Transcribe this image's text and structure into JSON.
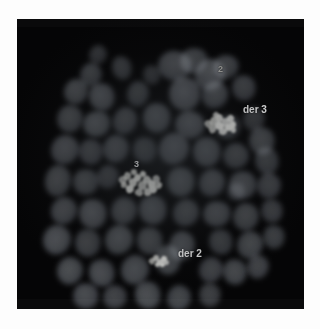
{
  "figure": {
    "kind": "fluorescence-micrograph",
    "modality": "FISH metaphase chromosome spread",
    "frame": {
      "x": 17,
      "y": 19,
      "width": 287,
      "height": 290
    },
    "background_color": "#050506",
    "page_background": "#fdfdfd",
    "chromatin_color": "#5d6166",
    "signal_color": "#f4f4ee",
    "label_color": "#ffffff"
  },
  "labels": [
    {
      "id": "label-2",
      "text": "2",
      "x": 201,
      "y": 46,
      "size": 9,
      "style": "dim"
    },
    {
      "id": "label-der-3",
      "text": "der 3",
      "x": 226,
      "y": 86,
      "size": 10,
      "style": "bright"
    },
    {
      "id": "label-3",
      "text": "3",
      "x": 117,
      "y": 141,
      "size": 9,
      "style": "bright"
    },
    {
      "id": "label-der-2",
      "text": "der 2",
      "x": 161,
      "y": 230,
      "size": 10,
      "style": "bright"
    }
  ],
  "signals": [
    {
      "id": "signal-der-3",
      "label": "der 3",
      "x": 186,
      "y": 92,
      "width": 34,
      "height": 26,
      "speckles": [
        [
          2,
          9,
          7,
          8
        ],
        [
          7,
          6,
          8,
          9
        ],
        [
          13,
          3,
          7,
          8
        ],
        [
          12,
          11,
          9,
          8
        ],
        [
          19,
          7,
          8,
          9
        ],
        [
          24,
          4,
          7,
          7
        ],
        [
          22,
          13,
          8,
          7
        ],
        [
          6,
          15,
          7,
          7
        ],
        [
          16,
          17,
          8,
          7
        ],
        [
          27,
          10,
          6,
          7
        ],
        [
          10,
          1,
          6,
          6
        ],
        [
          28,
          16,
          5,
          6
        ]
      ]
    },
    {
      "id": "signal-3",
      "label": "3",
      "x": 101,
      "y": 150,
      "width": 44,
      "height": 30,
      "speckles": [
        [
          1,
          7,
          8,
          8
        ],
        [
          6,
          3,
          7,
          8
        ],
        [
          11,
          9,
          8,
          9
        ],
        [
          16,
          5,
          7,
          8
        ],
        [
          20,
          12,
          9,
          9
        ],
        [
          25,
          7,
          8,
          8
        ],
        [
          30,
          11,
          8,
          9
        ],
        [
          35,
          6,
          7,
          8
        ],
        [
          38,
          13,
          6,
          7
        ],
        [
          8,
          16,
          8,
          8
        ],
        [
          17,
          20,
          8,
          7
        ],
        [
          26,
          19,
          8,
          8
        ],
        [
          32,
          17,
          7,
          7
        ],
        [
          3,
          13,
          6,
          6
        ],
        [
          13,
          0,
          6,
          6
        ],
        [
          22,
          2,
          6,
          6
        ]
      ]
    },
    {
      "id": "signal-der-2",
      "label": "der 2",
      "x": 132,
      "y": 235,
      "width": 20,
      "height": 13,
      "speckles": [
        [
          0,
          4,
          6,
          6
        ],
        [
          4,
          1,
          6,
          6
        ],
        [
          8,
          5,
          6,
          6
        ],
        [
          12,
          2,
          6,
          6
        ],
        [
          15,
          6,
          5,
          5
        ],
        [
          6,
          8,
          5,
          5
        ],
        [
          11,
          8,
          5,
          5
        ]
      ]
    }
  ],
  "chromosomes": [
    {
      "x": 63,
      "y": 44,
      "w": 22,
      "h": 24,
      "b": 66,
      "r": 12
    },
    {
      "x": 95,
      "y": 37,
      "w": 20,
      "h": 24,
      "b": 60,
      "r": -18
    },
    {
      "x": 141,
      "y": 32,
      "w": 34,
      "h": 30,
      "b": 78,
      "r": 8
    },
    {
      "x": 163,
      "y": 29,
      "w": 28,
      "h": 26,
      "b": 72,
      "r": -14
    },
    {
      "x": 178,
      "y": 40,
      "w": 30,
      "h": 32,
      "b": 84,
      "r": 20
    },
    {
      "x": 196,
      "y": 36,
      "w": 26,
      "h": 24,
      "b": 70,
      "r": -6
    },
    {
      "x": 47,
      "y": 60,
      "w": 24,
      "h": 26,
      "b": 74,
      "r": 16
    },
    {
      "x": 72,
      "y": 64,
      "w": 26,
      "h": 28,
      "b": 80,
      "r": -22
    },
    {
      "x": 110,
      "y": 62,
      "w": 22,
      "h": 26,
      "b": 64,
      "r": 10
    },
    {
      "x": 152,
      "y": 58,
      "w": 32,
      "h": 34,
      "b": 86,
      "r": -10
    },
    {
      "x": 185,
      "y": 62,
      "w": 26,
      "h": 28,
      "b": 76,
      "r": 26
    },
    {
      "x": 215,
      "y": 56,
      "w": 24,
      "h": 26,
      "b": 68,
      "r": -16
    },
    {
      "x": 40,
      "y": 86,
      "w": 26,
      "h": 28,
      "b": 72,
      "r": 6
    },
    {
      "x": 66,
      "y": 92,
      "w": 28,
      "h": 26,
      "b": 82,
      "r": -24
    },
    {
      "x": 96,
      "y": 88,
      "w": 24,
      "h": 28,
      "b": 70,
      "r": 18
    },
    {
      "x": 126,
      "y": 84,
      "w": 28,
      "h": 30,
      "b": 80,
      "r": -8
    },
    {
      "x": 158,
      "y": 92,
      "w": 30,
      "h": 28,
      "b": 84,
      "r": 14
    },
    {
      "x": 198,
      "y": 96,
      "w": 26,
      "h": 24,
      "b": 66,
      "r": -20
    },
    {
      "x": 226,
      "y": 88,
      "w": 22,
      "h": 24,
      "b": 58,
      "r": 12
    },
    {
      "x": 232,
      "y": 108,
      "w": 26,
      "h": 28,
      "b": 74,
      "r": -12
    },
    {
      "x": 34,
      "y": 116,
      "w": 28,
      "h": 30,
      "b": 78,
      "r": 22
    },
    {
      "x": 62,
      "y": 120,
      "w": 24,
      "h": 26,
      "b": 68,
      "r": -6
    },
    {
      "x": 86,
      "y": 116,
      "w": 26,
      "h": 28,
      "b": 76,
      "r": 10
    },
    {
      "x": 116,
      "y": 118,
      "w": 24,
      "h": 26,
      "b": 64,
      "r": -18
    },
    {
      "x": 142,
      "y": 114,
      "w": 30,
      "h": 32,
      "b": 86,
      "r": 16
    },
    {
      "x": 176,
      "y": 118,
      "w": 28,
      "h": 30,
      "b": 80,
      "r": -10
    },
    {
      "x": 206,
      "y": 124,
      "w": 26,
      "h": 26,
      "b": 70,
      "r": 24
    },
    {
      "x": 238,
      "y": 128,
      "w": 24,
      "h": 28,
      "b": 66,
      "r": -14
    },
    {
      "x": 28,
      "y": 146,
      "w": 26,
      "h": 32,
      "b": 74,
      "r": 8
    },
    {
      "x": 56,
      "y": 150,
      "w": 26,
      "h": 26,
      "b": 72,
      "r": -20
    },
    {
      "x": 80,
      "y": 146,
      "w": 22,
      "h": 24,
      "b": 62,
      "r": 14
    },
    {
      "x": 150,
      "y": 148,
      "w": 28,
      "h": 30,
      "b": 82,
      "r": -8
    },
    {
      "x": 182,
      "y": 150,
      "w": 26,
      "h": 28,
      "b": 76,
      "r": 18
    },
    {
      "x": 212,
      "y": 152,
      "w": 28,
      "h": 28,
      "b": 78,
      "r": -22
    },
    {
      "x": 240,
      "y": 154,
      "w": 24,
      "h": 26,
      "b": 68,
      "r": 6
    },
    {
      "x": 34,
      "y": 178,
      "w": 26,
      "h": 28,
      "b": 76,
      "r": 20
    },
    {
      "x": 62,
      "y": 180,
      "w": 28,
      "h": 30,
      "b": 84,
      "r": -10
    },
    {
      "x": 94,
      "y": 178,
      "w": 26,
      "h": 28,
      "b": 74,
      "r": 12
    },
    {
      "x": 122,
      "y": 176,
      "w": 28,
      "h": 30,
      "b": 80,
      "r": -16
    },
    {
      "x": 156,
      "y": 180,
      "w": 26,
      "h": 28,
      "b": 72,
      "r": 24
    },
    {
      "x": 186,
      "y": 182,
      "w": 28,
      "h": 26,
      "b": 78,
      "r": -6
    },
    {
      "x": 216,
      "y": 184,
      "w": 26,
      "h": 28,
      "b": 74,
      "r": 10
    },
    {
      "x": 244,
      "y": 180,
      "w": 22,
      "h": 24,
      "b": 62,
      "r": -18
    },
    {
      "x": 26,
      "y": 206,
      "w": 28,
      "h": 30,
      "b": 78,
      "r": 16
    },
    {
      "x": 58,
      "y": 210,
      "w": 26,
      "h": 28,
      "b": 70,
      "r": -8
    },
    {
      "x": 88,
      "y": 206,
      "w": 28,
      "h": 30,
      "b": 82,
      "r": 22
    },
    {
      "x": 120,
      "y": 208,
      "w": 26,
      "h": 28,
      "b": 74,
      "r": -14
    },
    {
      "x": 152,
      "y": 212,
      "w": 26,
      "h": 30,
      "b": 80,
      "r": 8
    },
    {
      "x": 192,
      "y": 210,
      "w": 24,
      "h": 26,
      "b": 66,
      "r": -20
    },
    {
      "x": 220,
      "y": 212,
      "w": 26,
      "h": 28,
      "b": 72,
      "r": 14
    },
    {
      "x": 246,
      "y": 206,
      "w": 22,
      "h": 24,
      "b": 60,
      "r": -10
    },
    {
      "x": 40,
      "y": 238,
      "w": 26,
      "h": 28,
      "b": 72,
      "r": 12
    },
    {
      "x": 72,
      "y": 240,
      "w": 26,
      "h": 28,
      "b": 76,
      "r": -22
    },
    {
      "x": 104,
      "y": 236,
      "w": 28,
      "h": 30,
      "b": 80,
      "r": 18
    },
    {
      "x": 138,
      "y": 226,
      "w": 26,
      "h": 30,
      "b": 82,
      "r": -6
    },
    {
      "x": 182,
      "y": 238,
      "w": 24,
      "h": 26,
      "b": 68,
      "r": 20
    },
    {
      "x": 206,
      "y": 240,
      "w": 24,
      "h": 26,
      "b": 70,
      "r": -12
    },
    {
      "x": 230,
      "y": 236,
      "w": 22,
      "h": 24,
      "b": 62,
      "r": 8
    },
    {
      "x": 56,
      "y": 264,
      "w": 26,
      "h": 26,
      "b": 68,
      "r": -16
    },
    {
      "x": 86,
      "y": 266,
      "w": 24,
      "h": 24,
      "b": 62,
      "r": 10
    },
    {
      "x": 118,
      "y": 262,
      "w": 26,
      "h": 28,
      "b": 74,
      "r": -24
    },
    {
      "x": 150,
      "y": 266,
      "w": 24,
      "h": 26,
      "b": 66,
      "r": 14
    },
    {
      "x": 182,
      "y": 264,
      "w": 22,
      "h": 24,
      "b": 58,
      "r": -8
    },
    {
      "x": 72,
      "y": 26,
      "w": 18,
      "h": 20,
      "b": 50,
      "r": 18
    },
    {
      "x": 126,
      "y": 46,
      "w": 18,
      "h": 20,
      "b": 52,
      "r": -12
    },
    {
      "x": 210,
      "y": 164,
      "w": 18,
      "h": 18,
      "b": 54,
      "r": 6
    }
  ]
}
